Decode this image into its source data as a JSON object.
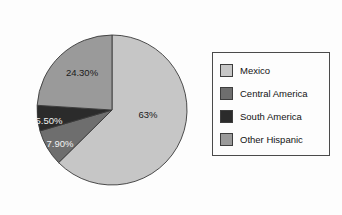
{
  "chart_data": {
    "type": "pie",
    "title": "",
    "legend_position": "right",
    "start_angle_deg": 0,
    "direction": "clockwise",
    "categories": [
      "Mexico",
      "Central America",
      "South America",
      "Other Hispanic"
    ],
    "values": [
      63,
      7.9,
      5.5,
      24.3
    ],
    "slices": [
      {
        "label": "Mexico",
        "value": 63,
        "data_label": "63%",
        "color": "#c6c6c6",
        "start_deg": 0,
        "end_deg": 225.4,
        "label_x": 148,
        "label_y": 115,
        "label_style": "dark"
      },
      {
        "label": "Central America",
        "value": 7.9,
        "data_label": "7.90%",
        "color": "#6e6e6e",
        "start_deg": 225.4,
        "end_deg": 253.8,
        "label_x": 60,
        "label_y": 144,
        "label_style": "light"
      },
      {
        "label": "South America",
        "value": 5.5,
        "data_label": "5.50%",
        "color": "#2b2b2b",
        "start_deg": 253.8,
        "end_deg": 273.6,
        "label_x": 49,
        "label_y": 121,
        "label_style": "light"
      },
      {
        "label": "Other Hispanic",
        "value": 24.3,
        "data_label": "24.30%",
        "color": "#9a9a9a",
        "start_deg": 273.6,
        "end_deg": 360,
        "label_x": 82,
        "label_y": 73,
        "label_style": "dark"
      }
    ],
    "center_x": 112,
    "center_y": 110,
    "radius": 75
  },
  "legend": {
    "items": [
      {
        "label": "Mexico",
        "color": "#c6c6c6"
      },
      {
        "label": "Central America",
        "color": "#6e6e6e"
      },
      {
        "label": "South America",
        "color": "#2b2b2b"
      },
      {
        "label": "Other Hispanic",
        "color": "#9a9a9a"
      }
    ]
  }
}
